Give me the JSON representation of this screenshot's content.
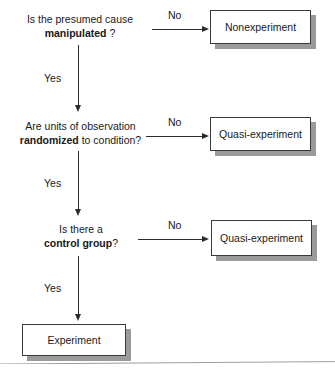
{
  "diagram": {
    "colors": {
      "box_border": "#3a3a3a",
      "box_fill": "#ffffff",
      "shadow": "#9a9a9a",
      "connector": "#2b2b2b",
      "text": "#191919"
    },
    "decisions": [
      {
        "id": "manipulated",
        "line1": "Is the presumed cause",
        "line2_prefix": "",
        "line2_bold": "manipulated",
        "line2_suffix": " ?",
        "no_label": "No",
        "yes_label": "Yes"
      },
      {
        "id": "randomized",
        "line1": "Are units of observation",
        "line2_prefix": "",
        "line2_bold": "randomized",
        "line2_suffix": " to condition?",
        "no_label": "No",
        "yes_label": "Yes"
      },
      {
        "id": "control-group",
        "line1": "Is there a",
        "line2_prefix": "",
        "line2_bold": "control group",
        "line2_suffix": "?",
        "no_label": "No",
        "yes_label": "Yes"
      }
    ],
    "outcomes": [
      {
        "id": "nonexperiment",
        "label": "Nonexperiment"
      },
      {
        "id": "quasi-experiment-1",
        "label": "Quasi-experiment"
      },
      {
        "id": "quasi-experiment-2",
        "label": "Quasi-experiment"
      },
      {
        "id": "experiment",
        "label": "Experiment"
      }
    ]
  }
}
